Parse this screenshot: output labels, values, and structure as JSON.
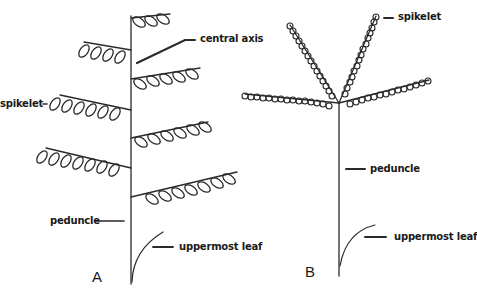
{
  "figure": {
    "title_partial": "Panicle diagram",
    "panels": [
      {
        "id": "A",
        "label": "A",
        "type": "racemose panicle with spikelets on lateral branches",
        "annotations": {
          "central_axis": "central axis",
          "spikelet": "spikelet",
          "peduncle": "peduncle",
          "uppermost_leaf": "uppermost leaf"
        }
      },
      {
        "id": "B",
        "label": "B",
        "type": "digitate panicle with branches from a common point",
        "annotations": {
          "spikelet": "spikelet",
          "peduncle": "peduncle",
          "uppermost_leaf": "uppermost leaf"
        }
      }
    ]
  },
  "colors": {
    "line": "#2a2a2a",
    "background": "#ffffff"
  }
}
